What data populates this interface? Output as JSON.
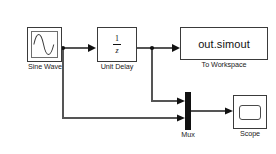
{
  "diagram": {
    "type": "simulink-block-diagram",
    "background": "#ffffff",
    "line_color": "#555555",
    "blocks": {
      "sine_wave": {
        "label": "Sine Wave",
        "icon": "sine-wave-icon",
        "x": 27,
        "y": 27,
        "w": 35,
        "h": 35
      },
      "unit_delay": {
        "label": "Unit Delay",
        "numerator": "1",
        "denominator": "z",
        "x": 97,
        "y": 27,
        "w": 40,
        "h": 35
      },
      "to_workspace": {
        "text": "out.simout",
        "label": "To Workspace",
        "x": 180,
        "y": 27,
        "w": 88,
        "h": 33
      },
      "mux": {
        "label": "Mux",
        "color": "#111111",
        "x": 185,
        "y": 92,
        "w": 6,
        "h": 38
      },
      "scope": {
        "label": "Scope",
        "icon": "scope-screen-icon",
        "x": 233,
        "y": 95,
        "w": 34,
        "h": 34
      }
    },
    "signals": [
      {
        "name": "sine-to-unitdelay",
        "from": "sine_wave",
        "to": "unit_delay"
      },
      {
        "name": "sine-branch-to-mux",
        "from": "sine_wave",
        "to": "mux-input-2"
      },
      {
        "name": "unitdelay-to-workspace",
        "from": "unit_delay",
        "to": "to_workspace"
      },
      {
        "name": "unitdelay-branch-to-mux",
        "from": "unit_delay",
        "to": "mux-input-1"
      },
      {
        "name": "mux-to-scope",
        "from": "mux",
        "to": "scope"
      }
    ],
    "junctions": [
      {
        "name": "sine-output-junction",
        "x": 63,
        "y": 48
      },
      {
        "name": "unitdelay-output-junction",
        "x": 152,
        "y": 48
      }
    ]
  }
}
